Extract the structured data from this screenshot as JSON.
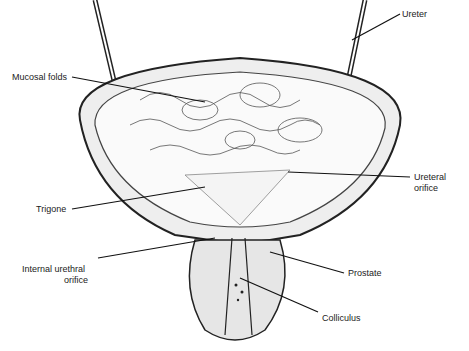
{
  "diagram": {
    "labels": {
      "ureter": "Ureter",
      "mucosal_folds": "Mucosal folds",
      "ureteral_orifice_1": "Ureteral",
      "ureteral_orifice_2": "orifice",
      "trigone": "Trigone",
      "internal_urethral_orifice_1": "Internal urethral",
      "internal_urethral_orifice_2": "orifice",
      "prostate": "Prostate",
      "colliculus": "Colliculus"
    }
  }
}
